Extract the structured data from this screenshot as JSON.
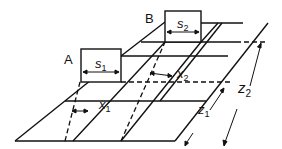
{
  "diagram": {
    "labels": {
      "load_a": "A",
      "load_b": "B",
      "width_a": "s",
      "width_a_sub": "1",
      "width_b": "s",
      "width_b_sub": "2",
      "offset_1": "x",
      "offset_1_sub": "1",
      "offset_2": "x",
      "offset_2_sub": "2",
      "depth_1": "z",
      "depth_1_sub": "1",
      "depth_2": "z",
      "depth_2_sub": "2"
    },
    "colors": {
      "line": "#111111",
      "background": "#ffffff"
    }
  }
}
